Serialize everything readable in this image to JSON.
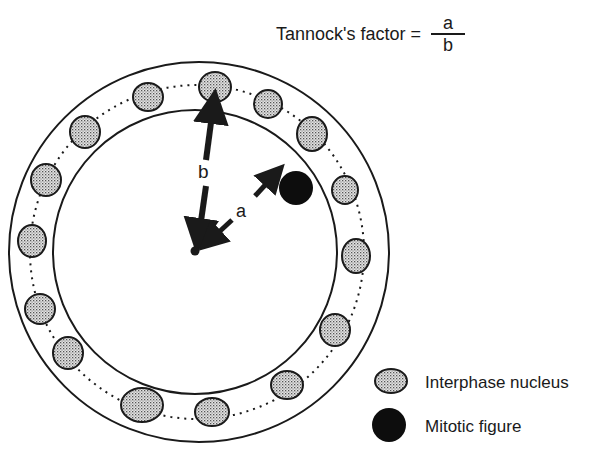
{
  "formula": {
    "label": "Tannock's factor =",
    "numerator": "a",
    "denominator": "b"
  },
  "diagram": {
    "outer_circle": {
      "cx": 199,
      "cy": 252,
      "r": 190
    },
    "inner_circle": {
      "cx": 195,
      "cy": 252,
      "r": 142
    },
    "center": {
      "cx": 195,
      "cy": 251
    },
    "arrow_b_label": "b",
    "arrow_a_label": "a",
    "nuclei": [
      {
        "cx": 215,
        "cy": 87,
        "rx": 16,
        "ry": 15
      },
      {
        "cx": 148,
        "cy": 97,
        "rx": 15,
        "ry": 14
      },
      {
        "cx": 268,
        "cy": 104,
        "rx": 14,
        "ry": 14
      },
      {
        "cx": 312,
        "cy": 134,
        "rx": 15,
        "ry": 17
      },
      {
        "cx": 85,
        "cy": 132,
        "rx": 15,
        "ry": 16
      },
      {
        "cx": 345,
        "cy": 190,
        "rx": 13,
        "ry": 14
      },
      {
        "cx": 46,
        "cy": 180,
        "rx": 15,
        "ry": 16
      },
      {
        "cx": 32,
        "cy": 241,
        "rx": 14,
        "ry": 16
      },
      {
        "cx": 356,
        "cy": 256,
        "rx": 14,
        "ry": 17
      },
      {
        "cx": 40,
        "cy": 309,
        "rx": 15,
        "ry": 15
      },
      {
        "cx": 335,
        "cy": 330,
        "rx": 15,
        "ry": 16
      },
      {
        "cx": 68,
        "cy": 353,
        "rx": 15,
        "ry": 16
      },
      {
        "cx": 287,
        "cy": 385,
        "rx": 16,
        "ry": 14
      },
      {
        "cx": 142,
        "cy": 405,
        "rx": 21,
        "ry": 17
      },
      {
        "cx": 212,
        "cy": 412,
        "rx": 17,
        "ry": 14
      }
    ],
    "mitotic_figure": {
      "cx": 296,
      "cy": 188,
      "r": 17
    }
  },
  "legend": {
    "items": [
      {
        "label": "Interphase nucleus",
        "type": "nucleus"
      },
      {
        "label": "Mitotic figure",
        "type": "mitotic"
      }
    ]
  },
  "colors": {
    "ink": "#1a1a1a",
    "nucleus_fill": "#c9c9c9",
    "background": "#ffffff"
  }
}
